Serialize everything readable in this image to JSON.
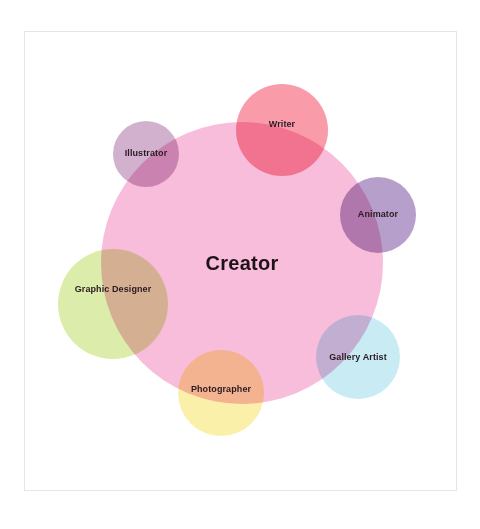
{
  "diagram": {
    "center": {
      "label": "Creator",
      "cx": 242,
      "cy": 263,
      "r": 141,
      "color": "#f7b6d6"
    },
    "satellites": [
      {
        "label": "Writer",
        "cx": 282,
        "cy": 130,
        "r": 46,
        "color": "#f88a9a",
        "label_y": 124
      },
      {
        "label": "Illustrator",
        "cx": 146,
        "cy": 154,
        "r": 33,
        "color": "#c9a3c6",
        "label_y": 153
      },
      {
        "label": "Animator",
        "cx": 378,
        "cy": 215,
        "r": 38,
        "color": "#a98fc2",
        "label_y": 214
      },
      {
        "label": "Graphic Designer",
        "cx": 113,
        "cy": 304,
        "r": 55,
        "color": "#d6ea9c",
        "label_y": 289
      },
      {
        "label": "Gallery Artist",
        "cx": 358,
        "cy": 357,
        "r": 42,
        "color": "#bfe8f2",
        "label_y": 357
      },
      {
        "label": "Photographer",
        "cx": 221,
        "cy": 393,
        "r": 43,
        "color": "#fbee9a",
        "label_y": 389
      }
    ]
  }
}
